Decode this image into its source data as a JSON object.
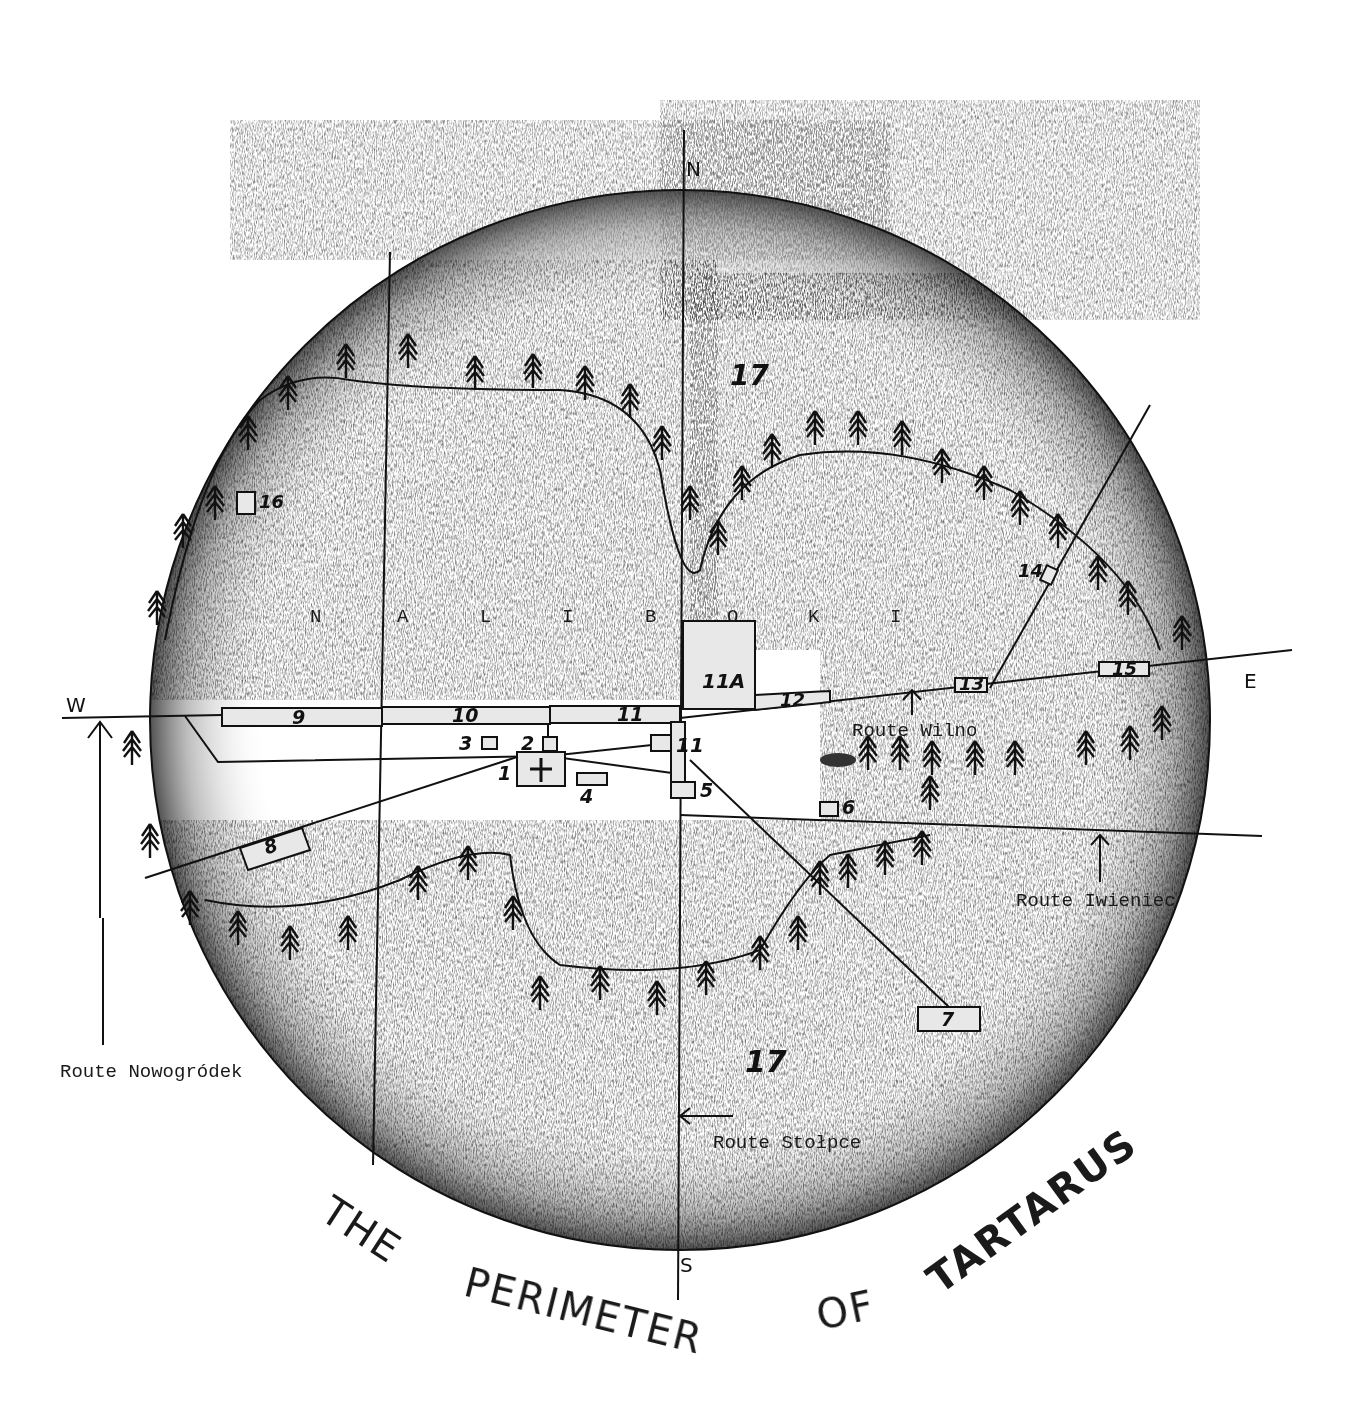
{
  "map": {
    "title_words": [
      "THE",
      "PERIMETER",
      "OF",
      "TARTARUS"
    ],
    "region_name_letters": [
      "N",
      "A",
      "L",
      "I",
      "B",
      "O",
      "K",
      "I"
    ],
    "compass": {
      "north": "N",
      "south": "S",
      "east": "E",
      "west": "W"
    },
    "forest_label": "17",
    "routes": [
      {
        "label": "Route Wilno"
      },
      {
        "label": "Route Iwieniec"
      },
      {
        "label": "Route Nowogródek"
      },
      {
        "label": "Route Stołpce"
      }
    ],
    "sites": [
      {
        "id": "1"
      },
      {
        "id": "2"
      },
      {
        "id": "3"
      },
      {
        "id": "4"
      },
      {
        "id": "5"
      },
      {
        "id": "6"
      },
      {
        "id": "7"
      },
      {
        "id": "8"
      },
      {
        "id": "9"
      },
      {
        "id": "10"
      },
      {
        "id": "11"
      },
      {
        "id": "11A"
      },
      {
        "id": "12"
      },
      {
        "id": "13"
      },
      {
        "id": "14"
      },
      {
        "id": "15"
      },
      {
        "id": "16"
      },
      {
        "id": "17"
      }
    ],
    "colors": {
      "ink": "#111111",
      "shading": "#6e6e6e",
      "paper": "#ffffff"
    }
  }
}
